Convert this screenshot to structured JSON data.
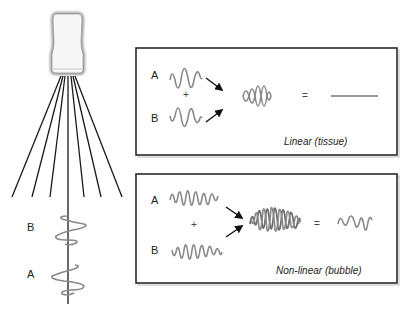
{
  "diagram": {
    "probe": {
      "label": "transducer-probe"
    },
    "beam": {
      "labels": {
        "pulse_b": "B",
        "pulse_a": "A"
      }
    },
    "panels": [
      {
        "id": "linear",
        "label_a": "A",
        "label_b": "B",
        "plus": "+",
        "equals": "=",
        "caption": "Linear (tissue)",
        "result": "flat line (cancellation)"
      },
      {
        "id": "nonlinear",
        "label_a": "A",
        "label_b": "B",
        "plus": "+",
        "equals": "=",
        "caption": "Non-linear (bubble)",
        "result": "residual non-linear signal"
      }
    ],
    "colors": {
      "wave": "#8a8a8a",
      "wave_dark": "#6e6e6e",
      "lines": "#1a1a1a",
      "box_border": "#2a2a2a",
      "background": "#ffffff"
    }
  }
}
